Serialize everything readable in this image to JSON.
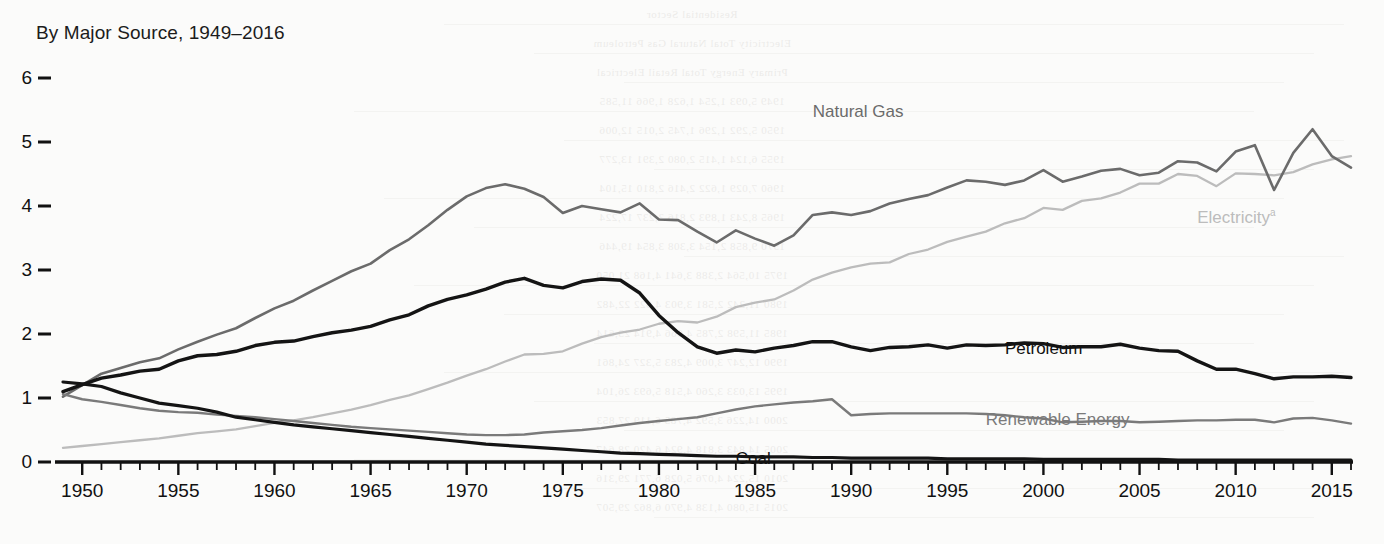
{
  "chart_data": {
    "type": "line",
    "title": "By Major Source, 1949–2016",
    "xlabel": "",
    "ylabel": "",
    "xlim": [
      1949,
      2016
    ],
    "ylim": [
      0,
      6
    ],
    "grid": false,
    "legend_position": "inline-labels",
    "ytick_labels": [
      "0",
      "1",
      "2",
      "3",
      "4",
      "5",
      "6"
    ],
    "ytick_values": [
      0,
      1,
      2,
      3,
      4,
      5,
      6
    ],
    "xtick_labels": [
      "1950",
      "1955",
      "1960",
      "1965",
      "1970",
      "1975",
      "1980",
      "1985",
      "1990",
      "1995",
      "2000",
      "2005",
      "2010",
      "2015"
    ],
    "xtick_values": [
      1950,
      1955,
      1960,
      1965,
      1970,
      1975,
      1980,
      1985,
      1990,
      1995,
      2000,
      2005,
      2010,
      2015
    ],
    "minor_tick_step": 1,
    "x": [
      1949,
      1950,
      1951,
      1952,
      1953,
      1954,
      1955,
      1956,
      1957,
      1958,
      1959,
      1960,
      1961,
      1962,
      1963,
      1964,
      1965,
      1966,
      1967,
      1968,
      1969,
      1970,
      1971,
      1972,
      1973,
      1974,
      1975,
      1976,
      1977,
      1978,
      1979,
      1980,
      1981,
      1982,
      1983,
      1984,
      1985,
      1986,
      1987,
      1988,
      1989,
      1990,
      1991,
      1992,
      1993,
      1994,
      1995,
      1996,
      1997,
      1998,
      1999,
      2000,
      2001,
      2002,
      2003,
      2004,
      2005,
      2006,
      2007,
      2008,
      2009,
      2010,
      2011,
      2012,
      2013,
      2014,
      2015,
      2016
    ],
    "series": [
      {
        "name": "Natural Gas",
        "color": "#6b6b6b",
        "width": 2.6,
        "label_x": 1988,
        "label_y": 5.62,
        "values": [
          1.02,
          1.2,
          1.38,
          1.47,
          1.56,
          1.62,
          1.76,
          1.88,
          1.99,
          2.09,
          2.25,
          2.4,
          2.52,
          2.68,
          2.83,
          2.98,
          3.1,
          3.31,
          3.48,
          3.7,
          3.94,
          4.15,
          4.28,
          4.34,
          4.27,
          4.14,
          3.89,
          4.0,
          3.95,
          3.9,
          4.04,
          3.79,
          3.78,
          3.6,
          3.43,
          3.62,
          3.49,
          3.38,
          3.54,
          3.86,
          3.9,
          3.86,
          3.92,
          4.04,
          4.11,
          4.17,
          4.29,
          4.4,
          4.38,
          4.33,
          4.4,
          4.56,
          4.38,
          4.46,
          4.55,
          4.58,
          4.48,
          4.52,
          4.7,
          4.68,
          4.54,
          4.85,
          4.95,
          4.25,
          4.83,
          5.2,
          4.78,
          4.6
        ]
      },
      {
        "name": "Electricity",
        "color": "#bcbcbc",
        "width": 2.3,
        "label_x": 2008,
        "label_y": 3.98,
        "label_note": "a",
        "values": [
          0.22,
          0.25,
          0.28,
          0.31,
          0.34,
          0.37,
          0.41,
          0.45,
          0.48,
          0.51,
          0.56,
          0.61,
          0.65,
          0.7,
          0.76,
          0.82,
          0.89,
          0.97,
          1.04,
          1.14,
          1.24,
          1.35,
          1.45,
          1.57,
          1.68,
          1.69,
          1.73,
          1.85,
          1.95,
          2.02,
          2.07,
          2.16,
          2.2,
          2.18,
          2.27,
          2.42,
          2.49,
          2.54,
          2.68,
          2.85,
          2.96,
          3.04,
          3.1,
          3.12,
          3.25,
          3.32,
          3.44,
          3.52,
          3.6,
          3.73,
          3.81,
          3.97,
          3.94,
          4.08,
          4.12,
          4.21,
          4.35,
          4.35,
          4.5,
          4.47,
          4.31,
          4.51,
          4.5,
          4.48,
          4.53,
          4.65,
          4.73,
          4.78
        ]
      },
      {
        "name": "Petroleum",
        "color": "#141414",
        "width": 3.4,
        "label_x": 1998,
        "label_y": 1.92,
        "values": [
          1.1,
          1.21,
          1.31,
          1.36,
          1.42,
          1.45,
          1.58,
          1.66,
          1.68,
          1.73,
          1.82,
          1.87,
          1.89,
          1.96,
          2.02,
          2.06,
          2.12,
          2.22,
          2.3,
          2.44,
          2.54,
          2.61,
          2.7,
          2.81,
          2.87,
          2.76,
          2.72,
          2.82,
          2.86,
          2.84,
          2.64,
          2.29,
          2.02,
          1.8,
          1.7,
          1.75,
          1.72,
          1.78,
          1.82,
          1.88,
          1.88,
          1.8,
          1.74,
          1.79,
          1.8,
          1.83,
          1.78,
          1.83,
          1.82,
          1.83,
          1.86,
          1.85,
          1.79,
          1.8,
          1.8,
          1.84,
          1.78,
          1.74,
          1.73,
          1.58,
          1.45,
          1.45,
          1.38,
          1.3,
          1.33,
          1.33,
          1.34,
          1.32
        ]
      },
      {
        "name": "Renewable Energy",
        "color": "#7a7a7a",
        "width": 2.4,
        "label_x": 1997,
        "label_y": 0.82,
        "values": [
          1.06,
          0.98,
          0.94,
          0.89,
          0.84,
          0.8,
          0.78,
          0.77,
          0.74,
          0.72,
          0.7,
          0.67,
          0.64,
          0.61,
          0.58,
          0.55,
          0.53,
          0.51,
          0.49,
          0.47,
          0.45,
          0.43,
          0.42,
          0.42,
          0.43,
          0.46,
          0.48,
          0.5,
          0.53,
          0.57,
          0.61,
          0.64,
          0.67,
          0.7,
          0.76,
          0.82,
          0.87,
          0.9,
          0.93,
          0.95,
          0.98,
          0.73,
          0.75,
          0.76,
          0.76,
          0.76,
          0.76,
          0.76,
          0.75,
          0.73,
          0.7,
          0.68,
          0.62,
          0.63,
          0.64,
          0.64,
          0.62,
          0.63,
          0.64,
          0.65,
          0.65,
          0.66,
          0.66,
          0.62,
          0.68,
          0.69,
          0.65,
          0.6
        ]
      },
      {
        "name": "Coal",
        "color": "#141414",
        "width": 3.2,
        "label_x": 1984,
        "label_y": 0.21,
        "values": [
          1.25,
          1.22,
          1.18,
          1.08,
          1.0,
          0.92,
          0.88,
          0.84,
          0.78,
          0.7,
          0.66,
          0.62,
          0.58,
          0.55,
          0.52,
          0.49,
          0.46,
          0.43,
          0.4,
          0.37,
          0.34,
          0.31,
          0.28,
          0.26,
          0.24,
          0.22,
          0.2,
          0.18,
          0.16,
          0.14,
          0.13,
          0.12,
          0.11,
          0.1,
          0.09,
          0.09,
          0.08,
          0.08,
          0.08,
          0.07,
          0.07,
          0.06,
          0.06,
          0.06,
          0.06,
          0.06,
          0.05,
          0.05,
          0.05,
          0.05,
          0.05,
          0.04,
          0.04,
          0.04,
          0.04,
          0.04,
          0.04,
          0.04,
          0.03,
          0.03,
          0.03,
          0.03,
          0.03,
          0.03,
          0.03,
          0.03,
          0.03,
          0.03
        ]
      }
    ]
  },
  "bleed_texture": {
    "rows": [
      "Residential Sector",
      "Electricity  Total  Natural Gas  Petroleum",
      "Primary  Energy  Total  Retail  Electrical",
      "1949  5,093  1,254  1,628  1,966  11,585",
      "1950  5,292  1,296  1,745  2,015  12,006",
      "1955  6,124  1,415  2,080  2,391  13,277",
      "1960  7,029  1,622  2,416  2,810  15,104",
      "1965  8,243  1,893  2,816  3,237  17,224",
      "1970  9,858  2,154  3,308  3,854  19,446",
      "1975 10,564  2,388  3,641  4,168  21,050",
      "1980 11,242  2,581  3,903  4,622  22,482",
      "1985 11,598  2,785  4,066  4,914  23,614",
      "1990 12,247  3,009  4,283  5,327  24,861",
      "1995 13,033  3,260  4,518  5,693  26,104",
      "2000 14,226  3,592  4,785  6,119  27,853",
      "2005 14,843  3,818  4,924  6,420  28,647",
      "2010 15,224  4,076  5,028  6,771  29,316",
      "2015 15,080  4,138  4,970  6,862  29,507"
    ]
  }
}
